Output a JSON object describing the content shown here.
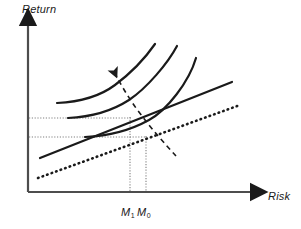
{
  "figure": {
    "kind": "economics-diagram",
    "background_color": "#ffffff",
    "ink_color": "#1a1a1a",
    "axis_color": "#4d4d4d"
  },
  "axes": {
    "y_label": "Return",
    "x_label": "Risk",
    "origin": {
      "x": 28,
      "y": 192
    },
    "y_top": {
      "x": 28,
      "y": 18
    },
    "x_right": {
      "x": 258,
      "y": 192
    },
    "arrowheads": true,
    "tick_labels": []
  },
  "markers": [
    {
      "name": "M1",
      "base": "M",
      "subscript": "1",
      "x": 130
    },
    {
      "name": "M0",
      "base": "M",
      "subscript": "0",
      "x": 146
    }
  ],
  "guides": {
    "horizontal": [
      {
        "name": "return-level-M1",
        "y": 118,
        "x_start": 29,
        "x_end": 131
      },
      {
        "name": "return-level-M0",
        "y": 137,
        "x_start": 29,
        "x_end": 147
      }
    ],
    "vertical": [
      {
        "name": "risk-level-M1",
        "x": 130,
        "y_start": 117,
        "y_end": 192
      },
      {
        "name": "risk-level-M0",
        "x": 146,
        "y_start": 136,
        "y_end": 192
      }
    ]
  },
  "chart_data": {
    "type": "line",
    "title": "",
    "xlabel": "Risk",
    "ylabel": "Return",
    "grid": false,
    "legend": null,
    "xlim": [
      28,
      258
    ],
    "ylim": [
      192,
      18
    ],
    "series": [
      {
        "name": "indifference-curve-1",
        "style": "solid",
        "stroke_width": 2.2,
        "points": [
          [
            57,
            103
          ],
          [
            75,
            101
          ],
          [
            95,
            96
          ],
          [
            112,
            87
          ],
          [
            128,
            73
          ],
          [
            140,
            60
          ],
          [
            150,
            50
          ],
          [
            155,
            44
          ]
        ]
      },
      {
        "name": "indifference-curve-2",
        "style": "solid",
        "stroke_width": 2.2,
        "points": [
          [
            68,
            118
          ],
          [
            88,
            116
          ],
          [
            108,
            111
          ],
          [
            126,
            102
          ],
          [
            144,
            88
          ],
          [
            158,
            72
          ],
          [
            170,
            57
          ],
          [
            177,
            46
          ]
        ]
      },
      {
        "name": "indifference-curve-3",
        "style": "solid",
        "stroke_width": 2.2,
        "points": [
          [
            85,
            137
          ],
          [
            105,
            135
          ],
          [
            125,
            131
          ],
          [
            145,
            123
          ],
          [
            163,
            110
          ],
          [
            177,
            95
          ],
          [
            190,
            75
          ],
          [
            196,
            58
          ]
        ]
      },
      {
        "name": "capital-market-line-new",
        "style": "solid",
        "stroke_width": 2.2,
        "points": [
          [
            40,
            158
          ],
          [
            232,
            82
          ]
        ]
      },
      {
        "name": "capital-market-line-old",
        "style": "dotted",
        "stroke_width": 2.6,
        "points": [
          [
            38,
            178
          ],
          [
            240,
            105
          ]
        ]
      },
      {
        "name": "shift-direction-arrow",
        "style": "dashed",
        "stroke_width": 1.6,
        "arrow": "start",
        "points": [
          [
            176,
            156
          ],
          [
            160,
            140
          ],
          [
            145,
            122
          ],
          [
            130,
            101
          ],
          [
            118,
            80
          ],
          [
            112,
            68
          ]
        ]
      }
    ]
  }
}
